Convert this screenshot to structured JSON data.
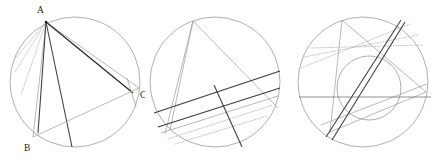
{
  "figure": {
    "width": 436,
    "height": 159,
    "background": "#ffffff",
    "colors": {
      "circle_outline": "#8c8c8c",
      "chord_light": "#9a9a9a",
      "chord_mid": "#6e6e6e",
      "chord_dark": "#3a3a3a",
      "chord_darker": "#2a2a2a",
      "chord_dotted": "#b9b2b4",
      "label_text": "#1a1a1a"
    }
  },
  "panels": [
    {
      "id": "panel-1",
      "name": "circle-diagram-left",
      "circle": {
        "cx": 75,
        "cy": 82,
        "r": 65
      },
      "labels": [
        {
          "text": "A",
          "x": 37,
          "y": 13
        },
        {
          "text": "B",
          "x": 24,
          "y": 151
        },
        {
          "text": "C",
          "x": 140,
          "y": 98
        }
      ],
      "points": {
        "A": {
          "x": 46,
          "y": 22
        },
        "B": {
          "x": 33,
          "y": 137
        },
        "C": {
          "x": 133,
          "y": 93
        }
      }
    },
    {
      "id": "panel-2",
      "name": "circle-diagram-middle",
      "circle": {
        "cx": 70,
        "cy": 82,
        "r": 65
      }
    },
    {
      "id": "panel-3",
      "name": "circle-diagram-right",
      "circle": {
        "cx": 73,
        "cy": 82,
        "r": 65
      },
      "inner_circle": {
        "cx": 79,
        "cy": 88,
        "r": 32
      }
    }
  ]
}
